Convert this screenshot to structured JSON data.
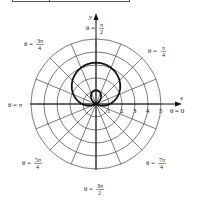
{
  "figure": {
    "axis_labels": {
      "x": "x",
      "y": "y"
    },
    "radial_ticks": [
      "1",
      "2",
      "3",
      "4",
      "5"
    ],
    "angle_labels": [
      {
        "id": "theta_0",
        "text": "θ = 0"
      },
      {
        "id": "theta_pi_4",
        "prefix": "θ =",
        "num": "π",
        "den": "4"
      },
      {
        "id": "theta_pi_2",
        "prefix": "θ =",
        "num": "π",
        "den": "2"
      },
      {
        "id": "theta_3pi_4",
        "prefix": "θ =",
        "num": "3π",
        "den": "4"
      },
      {
        "id": "theta_pi",
        "text": "θ = π"
      },
      {
        "id": "theta_5pi_4",
        "prefix": "θ =",
        "num": "5π",
        "den": "4"
      },
      {
        "id": "theta_3pi_2",
        "prefix": "θ =",
        "num": "3π",
        "den": "2"
      },
      {
        "id": "theta_7pi_4",
        "prefix": "θ =",
        "num": "7π",
        "den": "4"
      }
    ],
    "grid": {
      "circles": 5,
      "radial_lines": 16
    },
    "colors": {
      "grid": "#444444",
      "curve": "#111111",
      "text": "#222222"
    }
  }
}
